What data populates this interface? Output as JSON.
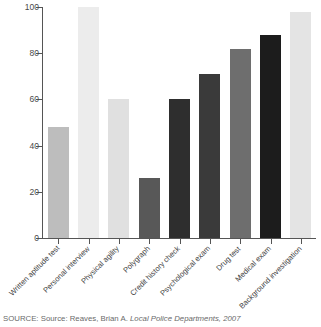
{
  "chart_data": {
    "type": "bar",
    "title": "",
    "subtitle": "",
    "xlabel": "",
    "ylabel": "",
    "ylim": [
      0,
      100
    ],
    "grid": false,
    "legend": null,
    "ticks": {
      "y": [
        "0",
        "20",
        "40",
        "60",
        "80",
        "100"
      ],
      "y_values": [
        0,
        20,
        40,
        60,
        80,
        100
      ]
    },
    "categories": [
      "Written aptitude test",
      "Personal interview",
      "Physical agility",
      "Polygraph",
      "Credit history check",
      "Psychological exam",
      "Drug test",
      "Medical exam",
      "Background investigation"
    ],
    "values": [
      48,
      100,
      60,
      26,
      60,
      71,
      82,
      88,
      98
    ],
    "bar_colors": [
      "#bdbdbd",
      "#ececec",
      "#e0e0e0",
      "#585858",
      "#2e2e2e",
      "#3a3a3a",
      "#6e6e6e",
      "#1c1c1c",
      "#e4e4e4"
    ]
  },
  "source": {
    "prefix": "SOURCE: Source: Reaves, Brian A. ",
    "italic": "Local Police Departments, 2007",
    "full": "SOURCE: Source: Reaves, Brian A. Local Police Departments, 2007"
  }
}
